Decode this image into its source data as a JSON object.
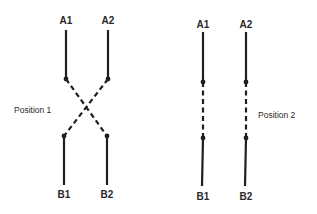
{
  "diagram": {
    "position1": {
      "label": "Position 1",
      "terminals": {
        "a1": "A1",
        "a2": "A2",
        "b1": "B1",
        "b2": "B2"
      },
      "connection": "crossed"
    },
    "position2": {
      "label": "Position 2",
      "terminals": {
        "a1": "A1",
        "a2": "A2",
        "b1": "B1",
        "b2": "B2"
      },
      "connection": "straight"
    },
    "colors": {
      "line": "#1f1f1f",
      "text": "#2a2a2a",
      "background": "#ffffff"
    }
  }
}
